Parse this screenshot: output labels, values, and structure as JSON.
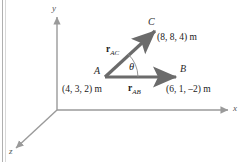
{
  "figure": {
    "type": "vector-diagram",
    "axes": {
      "x_label": "x",
      "y_label": "y",
      "z_label": "z"
    },
    "points": [
      {
        "id": "A",
        "label": "A",
        "coords_text": "(4, 3, 2) m"
      },
      {
        "id": "B",
        "label": "B",
        "coords_text": "(6, 1, –2) m"
      },
      {
        "id": "C",
        "label": "C",
        "coords_text": "(8, 8, 4) m"
      }
    ],
    "vectors": [
      {
        "id": "rAB",
        "symbol": "r",
        "subscript": "AB",
        "from": "A",
        "to": "B"
      },
      {
        "id": "rAC",
        "symbol": "r",
        "subscript": "AC",
        "from": "A",
        "to": "C"
      }
    ],
    "angle": {
      "symbol": "θ",
      "between": "rAB and rAC",
      "vertex": "A"
    },
    "colors": {
      "vector": "#6b6b6b",
      "axis": "#9a9a9a",
      "text": "#1a1a1a",
      "background": "#ffffff",
      "edge_rule": "#b0b0b0"
    }
  }
}
